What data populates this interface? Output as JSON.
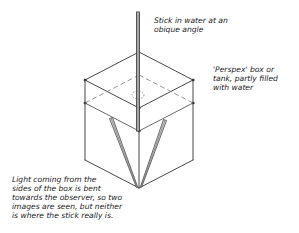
{
  "diagram": {
    "type": "refraction-illustration",
    "stroke_color": "#333333",
    "labels": {
      "stick": {
        "lines": [
          "Stick in water at an",
          "obique angle"
        ],
        "x": 154,
        "y": 16
      },
      "box": {
        "lines": [
          "'Perspex' box or",
          "tank, partly filled",
          "with water"
        ],
        "x": 213,
        "y": 65
      },
      "light": {
        "lines": [
          "Light coming from the",
          "sides of the box is bent",
          "towards the observer, so two",
          "images are seen, but neither",
          "is where the stick really is."
        ],
        "x": 12,
        "y": 175
      }
    },
    "box": {
      "top_back": [
        139,
        52
      ],
      "top_left": [
        85,
        80
      ],
      "top_right": [
        193,
        80
      ],
      "top_front": [
        139,
        108
      ],
      "water_left": [
        85,
        103
      ],
      "water_right": [
        193,
        103
      ],
      "water_front": [
        139,
        131
      ],
      "water_back": [
        139,
        75
      ],
      "bottom_left": [
        85,
        160
      ],
      "bottom_right": [
        193,
        160
      ],
      "bottom_front": [
        139,
        188
      ]
    },
    "stick": {
      "top": [
        138,
        12
      ],
      "water_entry": [
        138,
        95
      ],
      "bottom": [
        138,
        131
      ]
    },
    "refracted_images": [
      {
        "name": "left-image",
        "from": [
          111,
          118
        ],
        "to": [
          137,
          187
        ]
      },
      {
        "name": "right-image",
        "from": [
          165,
          120
        ],
        "to": [
          141,
          187
        ]
      }
    ]
  }
}
